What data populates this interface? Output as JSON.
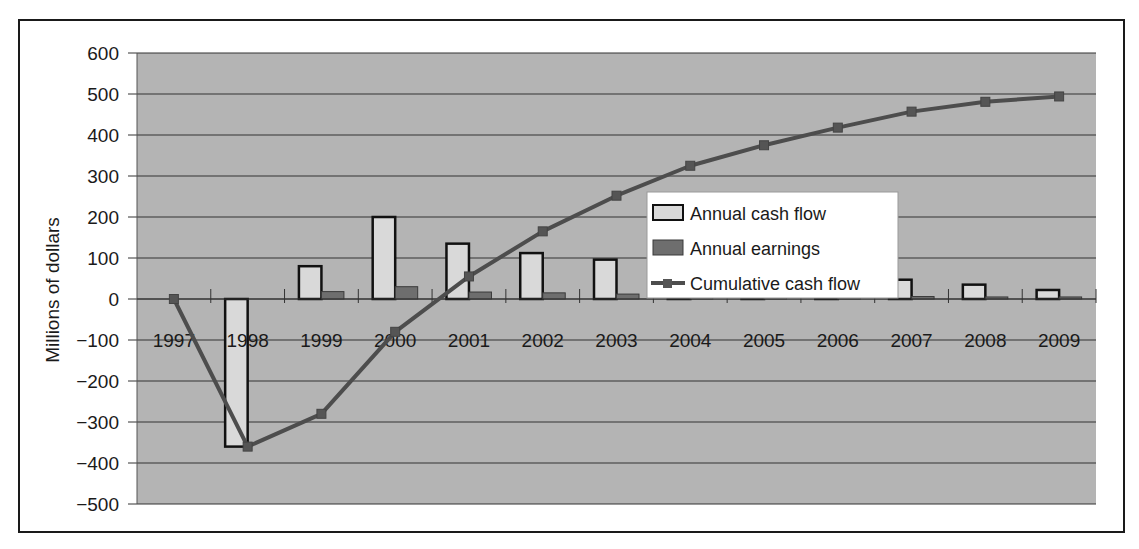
{
  "chart_data": {
    "type": "bar+line",
    "title": "",
    "xlabel": "",
    "ylabel": "Millions of dollars",
    "ylim": [
      -500,
      600
    ],
    "yticks": [
      600,
      500,
      400,
      300,
      200,
      100,
      0,
      -100,
      -200,
      -300,
      -400,
      -500
    ],
    "ytick_labels": [
      "600",
      "500",
      "400",
      "300",
      "200",
      "100",
      "0",
      "−100",
      "−200",
      "−300",
      "−400",
      "−500"
    ],
    "grid": true,
    "legend_position": "inside-center-right",
    "categories": [
      "1997",
      "1998",
      "1999",
      "2000",
      "2001",
      "2002",
      "2003",
      "2004",
      "2005",
      "2006",
      "2007",
      "2008",
      "2009"
    ],
    "series": [
      {
        "name": "Annual cash flow",
        "kind": "bar",
        "color": "#d9d9d9",
        "values": [
          0,
          -360,
          80,
          200,
          135,
          112,
          96,
          72,
          52,
          44,
          47,
          35,
          22
        ]
      },
      {
        "name": "Annual earnings",
        "kind": "bar",
        "color": "#6e6e6e",
        "values": [
          0,
          0,
          18,
          30,
          17,
          15,
          12,
          8,
          6,
          6,
          6,
          5,
          5
        ]
      },
      {
        "name": "Cumulative cash flow",
        "kind": "line",
        "color": "#4d4d4d",
        "values": [
          0,
          -360,
          -280,
          -80,
          55,
          165,
          252,
          325,
          375,
          418,
          457,
          481,
          494
        ]
      }
    ]
  },
  "colors": {
    "plot_bg": "#b4b4b4",
    "grid": "#333333",
    "bar_outline": "#111111"
  }
}
